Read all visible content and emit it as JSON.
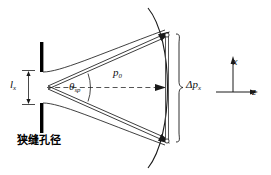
{
  "figure": {
    "background_color": "#ffffff",
    "line_color": "#1a1a1a",
    "bar_color": "#000000",
    "width": 271,
    "height": 175
  },
  "labels": {
    "slit_width": {
      "symbol": "l",
      "subscript": "x",
      "name": "slit-width-label"
    },
    "divergence_angle": {
      "symbol": "θ",
      "subscript": "sp",
      "name": "divergence-angle-label"
    },
    "momentum": {
      "symbol": "p",
      "subscript": "0",
      "name": "longitudinal-momentum-label"
    },
    "momentum_spread": {
      "symbol": "Δp",
      "subscript": "x",
      "name": "transverse-momentum-spread-label"
    },
    "axis_x": {
      "symbol": "x",
      "name": "x-axis-label"
    },
    "axis_z": {
      "symbol": "z",
      "name": "z-axis-label"
    },
    "aperture_caption": {
      "text": "狭缝孔径",
      "name": "slit-aperture-caption"
    }
  },
  "elements": {
    "slit_bar_top": "slit-bar-top",
    "slit_bar_bottom": "slit-bar-bottom",
    "beam_envelope_upper": "beam-envelope-upper-curve",
    "beam_envelope_lower": "beam-envelope-lower-curve",
    "momentum_vector_upper": "momentum-vector-upper",
    "momentum_vector_lower": "momentum-vector-lower",
    "momentum_vector_center": "momentum-vector-center",
    "wavefront_arc": "wavefront-arc",
    "momentum_spread_segment": "momentum-spread-segment",
    "brace": "momentum-spread-brace",
    "optical_axis": "optical-axis-dashed-line",
    "angle_arc": "divergence-angle-arc",
    "slit_dimension_arrow": "slit-width-dimension-arrow",
    "coordinate_axes": "coordinate-axes"
  }
}
